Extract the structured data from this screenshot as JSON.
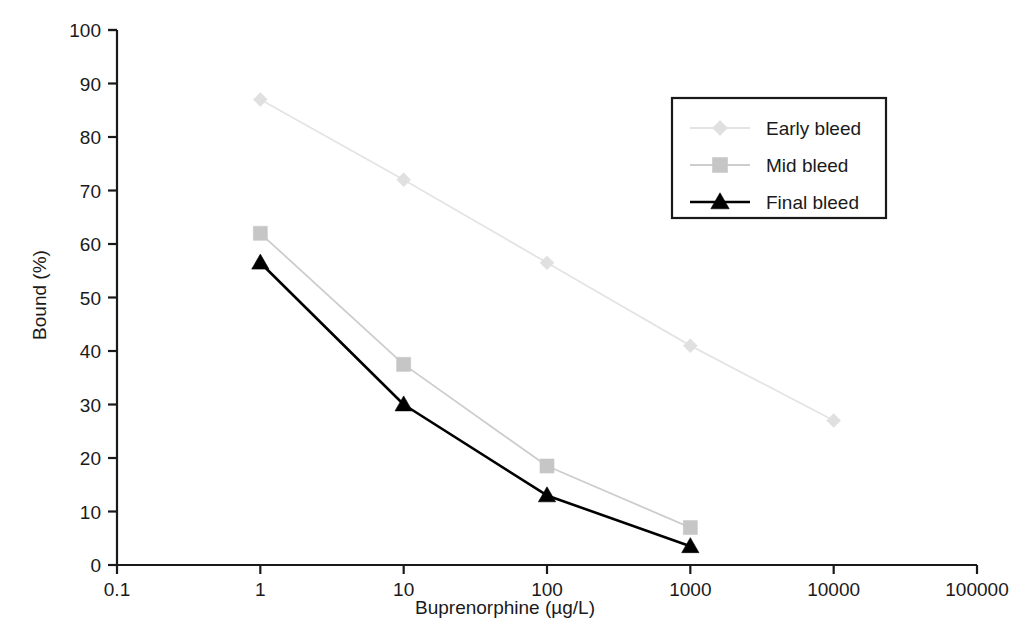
{
  "chart_data": {
    "type": "line",
    "title": "",
    "subtitle": "",
    "xlabel": "Buprenorphine (µg/L)",
    "ylabel": "Bound (%)",
    "xscale": "log",
    "yscale": "linear",
    "xlim": [
      0.1,
      100000
    ],
    "ylim": [
      0,
      100
    ],
    "x_ticks": [
      "0.1",
      "1",
      "10",
      "100",
      "1000",
      "10000",
      "100000"
    ],
    "x_tick_values": [
      0.1,
      1,
      10,
      100,
      1000,
      10000,
      100000
    ],
    "y_ticks": [
      "0",
      "10",
      "20",
      "30",
      "40",
      "50",
      "60",
      "70",
      "80",
      "90",
      "100"
    ],
    "y_tick_values": [
      0,
      10,
      20,
      30,
      40,
      50,
      60,
      70,
      80,
      90,
      100
    ],
    "grid": false,
    "legend_position": "upper right",
    "series": [
      {
        "name": "Early bleed",
        "marker": "diamond",
        "color": "#e0e0e0",
        "line_color": "#e4e4e4",
        "x": [
          1,
          10,
          100,
          1000,
          10000
        ],
        "values": [
          87,
          72,
          56.5,
          41,
          27
        ]
      },
      {
        "name": "Mid bleed",
        "marker": "square",
        "color": "#c6c6c6",
        "line_color": "#cdcdcd",
        "x": [
          1,
          10,
          100,
          1000
        ],
        "values": [
          62,
          37.5,
          18.5,
          7
        ]
      },
      {
        "name": "Final bleed",
        "marker": "triangle",
        "color": "#000000",
        "line_color": "#000000",
        "x": [
          1,
          10,
          100,
          1000
        ],
        "values": [
          56.5,
          30,
          13,
          3.5
        ]
      }
    ]
  },
  "legend": {
    "entries": [
      {
        "label": "Early bleed"
      },
      {
        "label": "Mid bleed"
      },
      {
        "label": "Final bleed"
      }
    ]
  },
  "axes": {
    "x_title": "Buprenorphine (µg/L)",
    "y_title": "Bound (%)"
  },
  "colors": {
    "early_bleed": "#e0e0e0",
    "mid_bleed": "#c6c6c6",
    "final_bleed": "#000000",
    "axis": "#1a1a1a",
    "background": "#ffffff"
  }
}
